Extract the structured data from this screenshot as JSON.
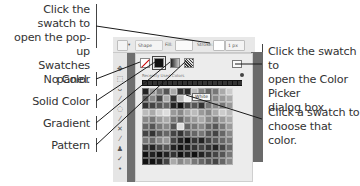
{
  "callouts": {
    "top_left": [
      "Click the swatch to",
      "open the pop-up",
      "Swatches panel."
    ],
    "no_color": "No Color",
    "solid_color": "Solid Color",
    "gradient": "Gradient",
    "pattern": "Pattern",
    "right_top": [
      "Click the swatch to",
      "open the Color Picker",
      "dialog box."
    ],
    "right_bottom": [
      "Click a swatch to",
      "choose that color."
    ]
  },
  "toolbar": {
    "shape_mode_label": "Shape",
    "fill_label": "Fill:",
    "stroke_label": "Stroke:",
    "stroke_width_value": "1 px"
  },
  "swatches_panel": {
    "recent_label": "Recently Used Colors",
    "tooltip": "White",
    "fill_types": [
      "No Color",
      "Solid Color",
      "Gradient",
      "Pattern"
    ],
    "grid_columns": 13,
    "grid_colors": [
      "#222",
      "#999",
      "#777",
      "#555",
      "#aaa",
      "#333",
      "#2a2a2a",
      "#bbb",
      "#888",
      "#666",
      "#777",
      "#aaa",
      "#ccc",
      "#555",
      "#888",
      "#444",
      "#aaa",
      "#333",
      "#bbb",
      "#eee",
      "#999",
      "#666",
      "#555",
      "#888",
      "#999",
      "#aaa",
      "#333",
      "#444",
      "#555",
      "#666",
      "#222",
      "#111",
      "#444",
      "#555",
      "#333",
      "#777",
      "#888",
      "#777",
      "#999",
      "#bbb",
      "#aaa",
      "#ccc",
      "#ddd",
      "#999",
      "#888",
      "#aaa",
      "#bbb",
      "#999",
      "#888",
      "#aaa",
      "#ccc",
      "#bbb",
      "#888",
      "#777",
      "#999",
      "#aaa",
      "#777",
      "#666",
      "#888",
      "#999",
      "#aaa",
      "#888",
      "#777",
      "#999",
      "#aaa",
      "#666",
      "#555",
      "#777",
      "#888",
      "#555",
      "#ddd",
      "#666",
      "#777",
      "#888",
      "#666",
      "#555",
      "#777",
      "#999",
      "#444",
      "#333",
      "#555",
      "#666",
      "#444",
      "#333",
      "#555",
      "#666",
      "#777",
      "#555",
      "#444",
      "#666",
      "#888",
      "#777",
      "#666",
      "#888",
      "#999",
      "#444",
      "#222",
      "#111",
      "#333",
      "#222",
      "#444",
      "#555",
      "#666",
      "#777",
      "#333",
      "#222",
      "#444",
      "#555",
      "#222",
      "#111",
      "#222",
      "#333",
      "#444",
      "#333",
      "#222",
      "#444",
      "#666",
      "#111",
      "#222",
      "#111",
      "#222",
      "#333",
      "#111",
      "#222",
      "#111",
      "#222",
      "#333",
      "#444",
      "#555",
      "#777",
      "#111",
      "#111",
      "#222",
      "#444",
      "#aaa",
      "#888",
      "#999",
      "#777",
      "#666",
      "#555",
      "#444",
      "#666",
      "#888"
    ]
  }
}
